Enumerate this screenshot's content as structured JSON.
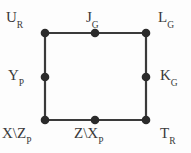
{
  "figure": {
    "type": "graph-diagram",
    "background_color": "#fdfdfd",
    "stroke_color": "#3a3a3a",
    "node_fill_color": "#2b2b2b",
    "width": 191,
    "height": 153
  },
  "nodes": [
    {
      "id": "u",
      "base": "U",
      "sub": "R",
      "label": "U_R",
      "x": 45,
      "y": 33,
      "position": "top-left"
    },
    {
      "id": "j",
      "base": "J",
      "sub": "G",
      "label": "J_G",
      "x": 95,
      "y": 33,
      "position": "top-middle"
    },
    {
      "id": "l",
      "base": "L",
      "sub": "G",
      "label": "L_G",
      "x": 146,
      "y": 33,
      "position": "top-right"
    },
    {
      "id": "y",
      "base": "Y",
      "sub": "P",
      "label": "Y_P",
      "x": 45,
      "y": 77,
      "position": "left-middle"
    },
    {
      "id": "k",
      "base": "K",
      "sub": "G",
      "label": "K_G",
      "x": 146,
      "y": 77,
      "position": "right-middle"
    },
    {
      "id": "xz",
      "base": "X\\Z",
      "sub": "P",
      "label": "X\\Z_P",
      "x": 45,
      "y": 120,
      "position": "bottom-left"
    },
    {
      "id": "zx",
      "base": "Z\\X",
      "sub": "P",
      "label": "Z\\X_P",
      "x": 95,
      "y": 120,
      "position": "bottom-middle"
    },
    {
      "id": "t",
      "base": "T",
      "sub": "R",
      "label": "T_R",
      "x": 146,
      "y": 120,
      "position": "bottom-right"
    }
  ],
  "edges": [
    {
      "id": "edge-top",
      "from": "u",
      "to": "l",
      "via": "j"
    },
    {
      "id": "edge-left",
      "from": "u",
      "to": "xz",
      "via": "y"
    },
    {
      "id": "edge-right",
      "from": "l",
      "to": "t",
      "via": "k"
    },
    {
      "id": "edge-bottom",
      "from": "xz",
      "to": "t",
      "via": "zx"
    }
  ]
}
